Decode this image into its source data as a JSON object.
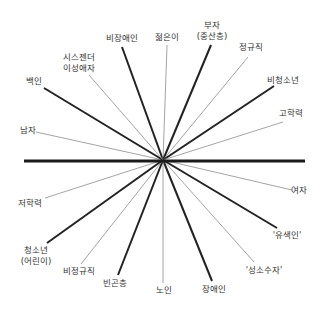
{
  "diagram": {
    "type": "privilege-axis-wheel",
    "center": {
      "x": 163,
      "y": 160
    },
    "divider": {
      "x1": 24,
      "y1": 161,
      "x2": 305,
      "y2": 161,
      "color": "#1a1a1a",
      "width": 3.2
    },
    "colors": {
      "thick": "#222222",
      "thin": "#9a9a9a",
      "text": "#333333"
    },
    "spokes": [
      {
        "id": "bijangaein",
        "label": "비장애인",
        "x": 122,
        "y": 47,
        "weight": "thick",
        "lx": 122,
        "ly": 38
      },
      {
        "id": "jeolmeuni",
        "label": "젊은이",
        "x": 167,
        "y": 45,
        "weight": "thin",
        "lx": 167,
        "ly": 37
      },
      {
        "id": "buja",
        "label": "부자\n(중산층)",
        "x": 211,
        "y": 45,
        "weight": "thick",
        "lx": 212,
        "ly": 31
      },
      {
        "id": "jeonggyujik",
        "label": "정규직",
        "x": 248,
        "y": 57,
        "weight": "thin",
        "lx": 251,
        "ly": 47
      },
      {
        "id": "bicheongsonyeon",
        "label": "비청소년",
        "x": 274,
        "y": 86,
        "weight": "thick",
        "lx": 283,
        "ly": 80
      },
      {
        "id": "gohakryeok",
        "label": "고학력",
        "x": 283,
        "y": 122,
        "weight": "thin",
        "lx": 291,
        "ly": 113
      },
      {
        "id": "yeoja",
        "label": "여자",
        "x": 292,
        "y": 190,
        "weight": "thin",
        "lx": 299,
        "ly": 190
      },
      {
        "id": "yusaegin",
        "label": "'유색인'",
        "x": 277,
        "y": 228,
        "weight": "thick",
        "lx": 287,
        "ly": 235
      },
      {
        "id": "seongsosuja",
        "label": "'성소수자'",
        "x": 254,
        "y": 262,
        "weight": "thin",
        "lx": 264,
        "ly": 270
      },
      {
        "id": "jangaein",
        "label": "장애인",
        "x": 212,
        "y": 281,
        "weight": "thick",
        "lx": 214,
        "ly": 289
      },
      {
        "id": "noin",
        "label": "노인",
        "x": 163,
        "y": 283,
        "weight": "thin",
        "lx": 164,
        "ly": 290
      },
      {
        "id": "bingoncheung",
        "label": "빈곤층",
        "x": 118,
        "y": 275,
        "weight": "thick",
        "lx": 115,
        "ly": 283
      },
      {
        "id": "bijeonggyujik",
        "label": "비정규직",
        "x": 81,
        "y": 264,
        "weight": "thin",
        "lx": 79,
        "ly": 271
      },
      {
        "id": "cheongsonyeon",
        "label": "청소년\n(어린이)",
        "x": 47,
        "y": 243,
        "weight": "thick",
        "lx": 36,
        "ly": 256
      },
      {
        "id": "jeohakryeok",
        "label": "저학력",
        "x": 45,
        "y": 198,
        "weight": "thin",
        "lx": 30,
        "ly": 203
      },
      {
        "id": "namja",
        "label": "남자",
        "x": 36,
        "y": 132,
        "weight": "thin",
        "lx": 28,
        "ly": 130
      },
      {
        "id": "baegin",
        "label": "백인",
        "x": 44,
        "y": 88,
        "weight": "thick",
        "lx": 34,
        "ly": 81
      },
      {
        "id": "siseujendeo",
        "label": "시스젠더\n이성애자",
        "x": 89,
        "y": 75,
        "weight": "thin",
        "lx": 79,
        "ly": 63
      }
    ]
  }
}
